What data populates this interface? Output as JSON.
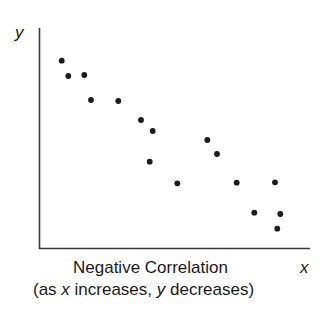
{
  "chart_data": {
    "type": "scatter",
    "title": "Negative Correlation",
    "subtitle": "(as x increases, y decreases)",
    "xlabel": "x",
    "ylabel": "y",
    "grid": false,
    "legend": null,
    "ticks": false,
    "points_px": [
      {
        "x": 61.7,
        "y": 60.7
      },
      {
        "x": 68.3,
        "y": 76
      },
      {
        "x": 84.3,
        "y": 75
      },
      {
        "x": 91,
        "y": 100
      },
      {
        "x": 118.3,
        "y": 101
      },
      {
        "x": 141,
        "y": 120
      },
      {
        "x": 152.7,
        "y": 131
      },
      {
        "x": 149.7,
        "y": 161.7
      },
      {
        "x": 177.3,
        "y": 183.3
      },
      {
        "x": 207.3,
        "y": 140
      },
      {
        "x": 217,
        "y": 154
      },
      {
        "x": 236.7,
        "y": 182.7
      },
      {
        "x": 275,
        "y": 182.3
      },
      {
        "x": 254.3,
        "y": 212.7
      },
      {
        "x": 280.3,
        "y": 214
      },
      {
        "x": 277.3,
        "y": 228.7
      }
    ],
    "points_normalized": [
      {
        "x": 0.08,
        "y": 0.86
      },
      {
        "x": 0.11,
        "y": 0.79
      },
      {
        "x": 0.17,
        "y": 0.79
      },
      {
        "x": 0.19,
        "y": 0.68
      },
      {
        "x": 0.29,
        "y": 0.68
      },
      {
        "x": 0.37,
        "y": 0.59
      },
      {
        "x": 0.42,
        "y": 0.54
      },
      {
        "x": 0.4,
        "y": 0.4
      },
      {
        "x": 0.51,
        "y": 0.3
      },
      {
        "x": 0.62,
        "y": 0.5
      },
      {
        "x": 0.65,
        "y": 0.43
      },
      {
        "x": 0.73,
        "y": 0.3
      },
      {
        "x": 0.87,
        "y": 0.3
      },
      {
        "x": 0.79,
        "y": 0.17
      },
      {
        "x": 0.89,
        "y": 0.16
      },
      {
        "x": 0.88,
        "y": 0.09
      }
    ],
    "correlation": "negative"
  },
  "axes": {
    "origin": {
      "x": 39.5,
      "y": 248.5
    },
    "y_top": 28,
    "x_right": 310
  },
  "labels": {
    "y_axis": "y",
    "x_axis": "x",
    "caption_line1": "Negative Correlation",
    "caption_line2_prefix": "(as ",
    "caption_line2_x": "x",
    "caption_line2_mid": " increases, ",
    "caption_line2_y": "y",
    "caption_line2_suffix": " decreases)"
  },
  "colors": {
    "axis": "#3a3a3a",
    "dot": "#1c1c1c",
    "text": "#1a1a1a",
    "background": "#ffffff"
  }
}
